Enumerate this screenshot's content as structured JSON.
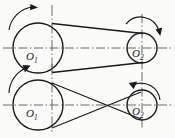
{
  "figure": {
    "stroke_color": "#1b1b1b",
    "centerline_color": "#4a4a4a",
    "background": "#fbfbfa",
    "width": 175,
    "height": 138
  },
  "diagrams": [
    {
      "name": "open-belt-drive",
      "belt_type": "open",
      "pulleys": [
        {
          "label": "O",
          "subscript": "1",
          "role": "driver",
          "cx": 38,
          "cy": 48,
          "r": 25,
          "rotation": "clockwise",
          "arrow_label": "clockwise-rotation-arrow"
        },
        {
          "label": "O",
          "subscript": "2",
          "role": "driven",
          "cx": 142,
          "cy": 48,
          "r": 15,
          "rotation": "clockwise",
          "arrow_label": "clockwise-rotation-arrow"
        }
      ]
    },
    {
      "name": "crossed-belt-drive",
      "belt_type": "crossed",
      "pulleys": [
        {
          "label": "O",
          "subscript": "1",
          "role": "driver",
          "cx": 38,
          "cy": 105,
          "r": 25,
          "rotation": "clockwise",
          "arrow_label": "clockwise-rotation-arrow"
        },
        {
          "label": "O",
          "subscript": "2",
          "role": "driven",
          "cx": 142,
          "cy": 105,
          "r": 15,
          "rotation": "counter-clockwise",
          "arrow_label": "counter-clockwise-rotation-arrow"
        }
      ]
    }
  ]
}
